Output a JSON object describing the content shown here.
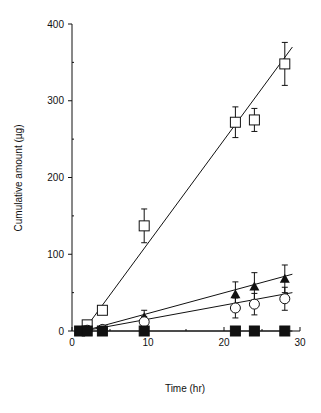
{
  "chart_data": {
    "type": "scatter",
    "title": "",
    "xlabel": "Time (hr)",
    "ylabel": "Cumulative amount (µg)",
    "xlim": [
      0,
      30
    ],
    "ylim": [
      0,
      400
    ],
    "xticks": [
      0,
      10,
      20,
      30
    ],
    "yticks": [
      0,
      100,
      200,
      300,
      400
    ],
    "grid": false,
    "legend": "none",
    "series": [
      {
        "name": "open squares",
        "marker": "open-square",
        "x": [
          2,
          4,
          9.5,
          21.5,
          24,
          28
        ],
        "y": [
          8,
          27,
          137,
          272,
          275,
          348
        ],
        "err": [
          0,
          0,
          22,
          20,
          15,
          28
        ],
        "fit": {
          "x": [
            1.5,
            29
          ],
          "y": [
            0,
            370
          ]
        }
      },
      {
        "name": "filled triangles",
        "marker": "filled-triangle",
        "x": [
          2,
          4,
          9.5,
          21.5,
          24,
          28
        ],
        "y": [
          1,
          3,
          18,
          48,
          58,
          68
        ],
        "err": [
          0,
          3,
          9,
          16,
          18,
          18
        ],
        "fit": {
          "x": [
            1.5,
            29
          ],
          "y": [
            0,
            74
          ]
        }
      },
      {
        "name": "open circles",
        "marker": "open-circle",
        "x": [
          2,
          4,
          9.5,
          21.5,
          24,
          28
        ],
        "y": [
          1,
          2,
          12,
          30,
          35,
          42
        ],
        "err": [
          0,
          2,
          7,
          13,
          14,
          15
        ],
        "fit": {
          "x": [
            1.5,
            29
          ],
          "y": [
            0,
            50
          ]
        }
      },
      {
        "name": "filled squares",
        "marker": "filled-square",
        "x": [
          1,
          2,
          4,
          9.5,
          21.5,
          24,
          28
        ],
        "y": [
          0,
          0,
          0,
          0,
          0,
          0,
          0
        ],
        "err": [
          0,
          0,
          0,
          0,
          0,
          0,
          0
        ],
        "fit": {
          "x": [
            1,
            29
          ],
          "y": [
            0,
            0
          ]
        }
      }
    ]
  },
  "labels": {
    "xlabel": "Time (hr)",
    "ylabel": "Cumulative amount (µg)"
  }
}
